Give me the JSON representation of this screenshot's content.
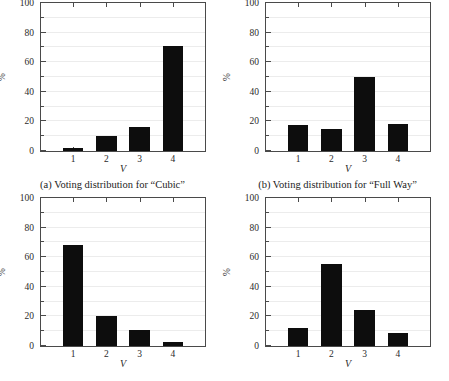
{
  "figure": {
    "panel_count": 4,
    "axis_label_y": "%",
    "axis_label_x": "V",
    "y_ticks": [
      "0",
      "20",
      "40",
      "60",
      "80",
      "100"
    ],
    "x_ticks": [
      "1",
      "2",
      "3",
      "4"
    ],
    "bar_color": "#0d0d0d",
    "axis_color": "#4a4a4a",
    "grid_color": "#ececec"
  },
  "panels": [
    {
      "id": "a",
      "caption": "(a) Voting distribution for “Cubic”",
      "has_caption": true,
      "chart_data": {
        "type": "bar",
        "title": "(a) Voting distribution for “Cubic”",
        "categories": [
          "1",
          "2",
          "3",
          "4"
        ],
        "values": [
          2,
          10,
          16.5,
          71
        ],
        "xlabel": "V",
        "ylabel": "%",
        "ylim": [
          0,
          100
        ],
        "yticks": [
          0,
          20,
          40,
          60,
          80,
          100
        ],
        "grid": true,
        "legend": "none"
      }
    },
    {
      "id": "b",
      "caption": "(b) Voting distribution for “Full Way”",
      "has_caption": true,
      "chart_data": {
        "type": "bar",
        "title": "(b) Voting distribution for “Full Way”",
        "categories": [
          "1",
          "2",
          "3",
          "4"
        ],
        "values": [
          17.5,
          15,
          50,
          18
        ],
        "xlabel": "V",
        "ylabel": "%",
        "ylim": [
          0,
          100
        ],
        "yticks": [
          0,
          20,
          40,
          60,
          80,
          100
        ],
        "grid": true,
        "legend": "none"
      }
    },
    {
      "id": "c",
      "caption": "",
      "has_caption": false,
      "chart_data": {
        "type": "bar",
        "title": "",
        "categories": [
          "1",
          "2",
          "3",
          "4"
        ],
        "values": [
          68,
          20,
          10.5,
          3
        ],
        "xlabel": "V",
        "ylabel": "%",
        "ylim": [
          0,
          100
        ],
        "yticks": [
          0,
          20,
          40,
          60,
          80,
          100
        ],
        "grid": true,
        "legend": "none"
      }
    },
    {
      "id": "d",
      "caption": "",
      "has_caption": false,
      "chart_data": {
        "type": "bar",
        "title": "",
        "categories": [
          "1",
          "2",
          "3",
          "4"
        ],
        "values": [
          12,
          55.5,
          24,
          9
        ],
        "xlabel": "V",
        "ylabel": "%",
        "ylim": [
          0,
          100
        ],
        "yticks": [
          0,
          20,
          40,
          60,
          80,
          100
        ],
        "grid": true,
        "legend": "none"
      }
    }
  ]
}
